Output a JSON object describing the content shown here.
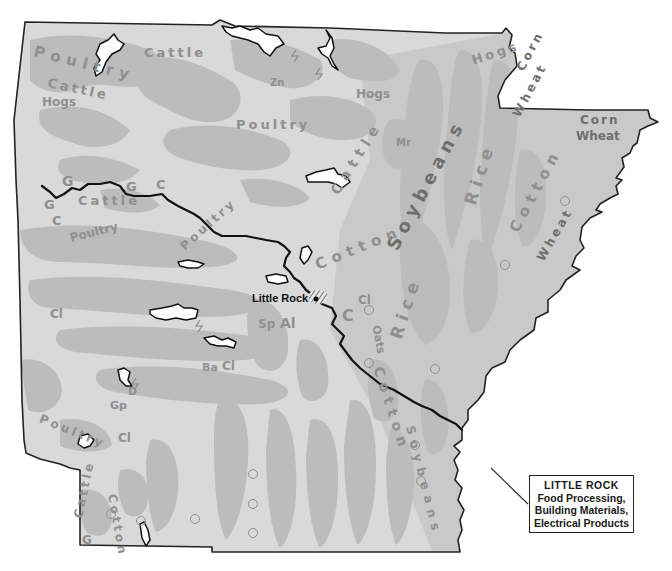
{
  "map": {
    "title": "Arkansas — Agricultural products, minerals and industry",
    "region": "Arkansas",
    "colors": {
      "background": "#ffffff",
      "land_light": "#dcdcdc",
      "land_mid": "#bdbdbd",
      "land_delta": "#c8c8c8",
      "label_gray": "#8f8f8f",
      "river": "#111111",
      "lake_fill": "#ffffff",
      "border": "#222222"
    },
    "city": {
      "name": "Little Rock",
      "marker": "dot-with-hatched-area"
    },
    "callout": {
      "title": "LITTLE ROCK",
      "lines": [
        "Food Processing,",
        "Building Materials,",
        "Electrical Products"
      ]
    },
    "product_labels": [
      {
        "text": "Poultry",
        "region": "northwest"
      },
      {
        "text": "Cattle",
        "region": "north"
      },
      {
        "text": "Cattle",
        "region": "northwest"
      },
      {
        "text": "Hogs",
        "region": "northwest"
      },
      {
        "text": "Zn",
        "region": "north-central"
      },
      {
        "text": "Hogs",
        "region": "north-central"
      },
      {
        "text": "Poultry",
        "region": "north-central"
      },
      {
        "text": "Hogs",
        "region": "northeast"
      },
      {
        "text": "Mr",
        "region": "north-central"
      },
      {
        "text": "Corn",
        "region": "northeast"
      },
      {
        "text": "Wheat",
        "region": "northeast"
      },
      {
        "text": "Corn",
        "region": "northeast corner"
      },
      {
        "text": "Wheat",
        "region": "northeast corner"
      },
      {
        "text": "Soybeans",
        "region": "eastern delta"
      },
      {
        "text": "Rice",
        "region": "eastern delta"
      },
      {
        "text": "Cotton",
        "region": "eastern delta"
      },
      {
        "text": "Wheat",
        "region": "east"
      },
      {
        "text": "Cattle",
        "region": "central"
      },
      {
        "text": "Cotton",
        "region": "central"
      },
      {
        "text": "G",
        "region": "west"
      },
      {
        "text": "G",
        "region": "west"
      },
      {
        "text": "C",
        "region": "west"
      },
      {
        "text": "G",
        "region": "west"
      },
      {
        "text": "C",
        "region": "west"
      },
      {
        "text": "Cattle",
        "region": "west"
      },
      {
        "text": "Poultry",
        "region": "west"
      },
      {
        "text": "Poultry",
        "region": "west-central"
      },
      {
        "text": "Cl",
        "region": "west"
      },
      {
        "text": "Cl",
        "region": "central"
      },
      {
        "text": "C",
        "region": "central"
      },
      {
        "text": "Sp",
        "region": "central"
      },
      {
        "text": "Al",
        "region": "central"
      },
      {
        "text": "Ba",
        "region": "southwest-central"
      },
      {
        "text": "Cl",
        "region": "southwest-central"
      },
      {
        "text": "D",
        "region": "southwest"
      },
      {
        "text": "Gp",
        "region": "southwest"
      },
      {
        "text": "Poultry",
        "region": "southwest"
      },
      {
        "text": "Cl",
        "region": "southwest"
      },
      {
        "text": "Cattle",
        "region": "southwest"
      },
      {
        "text": "Cotton",
        "region": "southwest"
      },
      {
        "text": "G",
        "region": "southwest"
      },
      {
        "text": "Oats",
        "region": "southeast"
      },
      {
        "text": "Rice",
        "region": "southeast"
      },
      {
        "text": "Cotton",
        "region": "southeast"
      },
      {
        "text": "Soybeans",
        "region": "southeast"
      }
    ],
    "symbols": {
      "oil_well": "open-circle",
      "lake": "white-shape-black-outline",
      "river": "Arkansas River black line"
    }
  }
}
